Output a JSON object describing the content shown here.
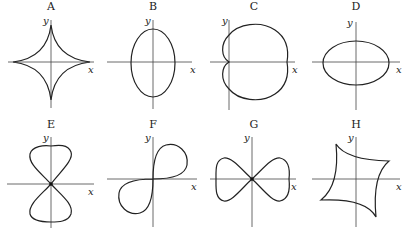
{
  "figure": {
    "panels": [
      {
        "id": "A",
        "label": "A",
        "curve": "astroid",
        "x_label": "x",
        "y_label": "y"
      },
      {
        "id": "B",
        "label": "B",
        "curve": "vertical ellipse",
        "x_label": "x",
        "y_label": "y"
      },
      {
        "id": "C",
        "label": "C",
        "curve": "cardioid (opening right)",
        "x_label": "x",
        "y_label": "y"
      },
      {
        "id": "D",
        "label": "D",
        "curve": "horizontal ellipse",
        "x_label": "x",
        "y_label": "y"
      },
      {
        "id": "E",
        "label": "E",
        "curve": "vertical figure-eight",
        "x_label": "x",
        "y_label": "y"
      },
      {
        "id": "F",
        "label": "F",
        "curve": "diagonal lemniscate",
        "x_label": "x",
        "y_label": "y"
      },
      {
        "id": "G",
        "label": "G",
        "curve": "horizontal figure-eight",
        "x_label": "x",
        "y_label": "y"
      },
      {
        "id": "H",
        "label": "H",
        "curve": "skewed astroid",
        "x_label": "x",
        "y_label": "y"
      }
    ]
  },
  "colors": {
    "curve": "#222222",
    "axis": "#444444",
    "background": "#ffffff"
  }
}
